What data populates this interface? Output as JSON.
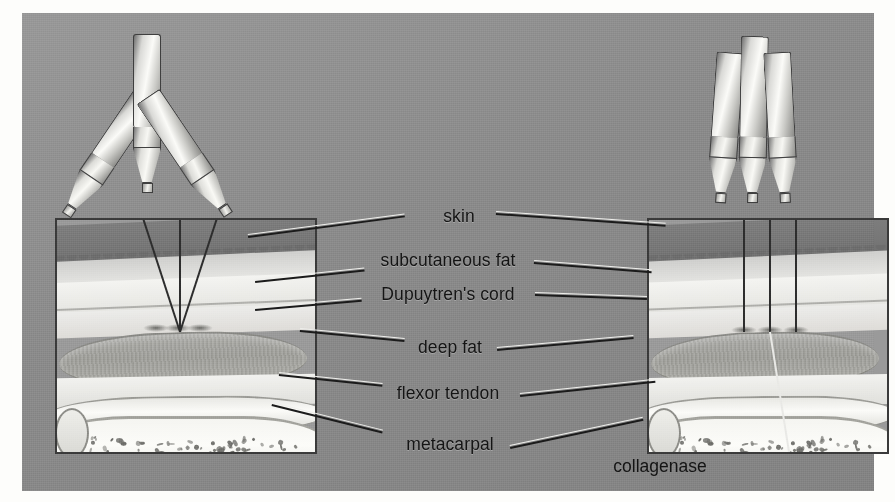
{
  "figure": {
    "type": "medical-illustration",
    "background_color": "#8d8d8d",
    "page_color": "#fdfdfb",
    "border_color": "#3a3a3a",
    "text_color": "#141414"
  },
  "labels": [
    {
      "id": "skin",
      "text": "skin",
      "x": 459,
      "y": 216
    },
    {
      "id": "subcutaneous-fat",
      "text": "subcutaneous fat",
      "x": 448,
      "y": 260
    },
    {
      "id": "dupuytrens-cord",
      "text": "Dupuytren's cord",
      "x": 448,
      "y": 294
    },
    {
      "id": "deep-fat",
      "text": "deep fat",
      "x": 450,
      "y": 347
    },
    {
      "id": "flexor-tendon",
      "text": "flexor tendon",
      "x": 448,
      "y": 393
    },
    {
      "id": "metacarpal",
      "text": "metacarpal",
      "x": 450,
      "y": 444
    },
    {
      "id": "collagenase",
      "text": "collagenase",
      "x": 660,
      "y": 466
    }
  ],
  "panels": {
    "left": {
      "name": "converging-needles-panel",
      "caption": "Three syringes angled so the needles converge into a single point within the Dupuytren's cord",
      "needle_count": 3,
      "needle_arrangement": "converging"
    },
    "right": {
      "name": "parallel-needles-panel",
      "caption": "Three syringes held vertically so the needles enter the cord in parallel",
      "needle_count": 3,
      "needle_arrangement": "parallel"
    }
  },
  "anatomy_layers": [
    {
      "id": "epidermis",
      "name": "skin",
      "tone": "#7b7b7b"
    },
    {
      "id": "dermis",
      "name": "dermis",
      "tone": "#d8d8d5"
    },
    {
      "id": "subcutaneous-fat",
      "name": "subcutaneous fat",
      "tone": "#f4f4f1"
    },
    {
      "id": "dupuytrens-cord",
      "name": "Dupuytren's cord",
      "tone": "#a3a39e"
    },
    {
      "id": "deep-fat",
      "name": "deep fat",
      "tone": "#f2f2ef"
    },
    {
      "id": "flexor-tendon",
      "name": "flexor tendon",
      "tone": "#f0f0ec"
    },
    {
      "id": "metacarpal",
      "name": "metacarpal",
      "tone": "#f8f8f4"
    }
  ]
}
